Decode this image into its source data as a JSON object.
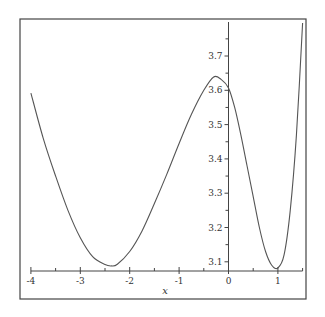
{
  "chart_data": {
    "type": "line",
    "title": "",
    "xlabel": "x",
    "ylabel": "",
    "xlim": [
      -4,
      1.5
    ],
    "ylim": [
      3.074,
      3.8
    ],
    "grid": false,
    "legend": null,
    "x_ticks": [
      -4,
      -3,
      -2,
      -1,
      0,
      1
    ],
    "x_tick_labels": [
      "-4",
      "-3",
      "-2",
      "-1",
      "0",
      "1"
    ],
    "y_ticks": [
      3.1,
      3.2,
      3.3,
      3.4,
      3.5,
      3.6,
      3.7
    ],
    "y_tick_labels": [
      "3.1",
      "3.2",
      "3.3",
      "3.4",
      "3.5",
      "3.6",
      "3.7"
    ],
    "series": [
      {
        "name": "f(x)",
        "color": "#555555",
        "x": [
          -4.0,
          -3.75,
          -3.5,
          -3.25,
          -3.0,
          -2.75,
          -2.5,
          -2.37,
          -2.25,
          -2.0,
          -1.75,
          -1.5,
          -1.25,
          -1.0,
          -0.75,
          -0.5,
          -0.3,
          -0.15,
          0.0,
          0.125,
          0.25,
          0.375,
          0.5,
          0.625,
          0.75,
          0.875,
          1.0,
          1.125,
          1.25,
          1.375,
          1.5
        ],
        "y": [
          3.592,
          3.46,
          3.35,
          3.25,
          3.17,
          3.115,
          3.092,
          3.088,
          3.093,
          3.13,
          3.19,
          3.27,
          3.355,
          3.445,
          3.53,
          3.6,
          3.639,
          3.632,
          3.607,
          3.55,
          3.47,
          3.38,
          3.29,
          3.2,
          3.13,
          3.09,
          3.082,
          3.12,
          3.25,
          3.47,
          3.796
        ]
      }
    ]
  },
  "labels": {
    "x_axis": "x"
  }
}
